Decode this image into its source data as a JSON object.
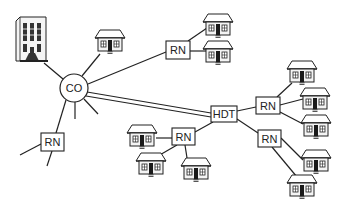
{
  "diagram": {
    "type": "network-topology",
    "nodes": {
      "central_office": {
        "label": "CO",
        "shape": "circle",
        "cx": 74,
        "cy": 88,
        "r": 14
      },
      "hdt": {
        "label": "HDT",
        "shape": "box",
        "x": 211,
        "y": 106,
        "w": 26,
        "h": 16
      },
      "rn_top": {
        "label": "RN",
        "shape": "box",
        "x": 166,
        "y": 41,
        "w": 24,
        "h": 18
      },
      "rn_left": {
        "label": "RN",
        "shape": "box",
        "x": 41,
        "y": 133,
        "w": 23,
        "h": 18
      },
      "rn_center": {
        "label": "RN",
        "shape": "box",
        "x": 172,
        "y": 128,
        "w": 23,
        "h": 17
      },
      "rn_right_upper": {
        "label": "RN",
        "shape": "box",
        "x": 256,
        "y": 97,
        "w": 24,
        "h": 17
      },
      "rn_right_lower": {
        "label": "RN",
        "shape": "box",
        "x": 258,
        "y": 130,
        "w": 23,
        "h": 17
      }
    },
    "building": {
      "icon": "office-building-icon",
      "x": 16,
      "y": 17,
      "w": 30,
      "h": 48
    },
    "houses": [
      {
        "id": "house-co",
        "x": 95,
        "y": 29
      },
      {
        "id": "house-rn-top-1",
        "x": 203,
        "y": 13
      },
      {
        "id": "house-rn-top-2",
        "x": 203,
        "y": 40
      },
      {
        "id": "house-rnru-1",
        "x": 287,
        "y": 61
      },
      {
        "id": "house-rnru-2",
        "x": 300,
        "y": 87
      },
      {
        "id": "house-rnru-3",
        "x": 301,
        "y": 114
      },
      {
        "id": "house-rnrl-1",
        "x": 301,
        "y": 149
      },
      {
        "id": "house-rnrl-2",
        "x": 287,
        "y": 175
      },
      {
        "id": "house-rnc-1",
        "x": 128,
        "y": 124
      },
      {
        "id": "house-rnc-2",
        "x": 136,
        "y": 152
      },
      {
        "id": "house-rnc-3",
        "x": 181,
        "y": 157
      }
    ],
    "links": [
      {
        "from": "central_office",
        "to": "building",
        "style": "single"
      },
      {
        "from": "central_office",
        "to": "house-co",
        "style": "single"
      },
      {
        "from": "central_office",
        "to": "rn_top",
        "style": "single"
      },
      {
        "from": "central_office",
        "to": "hdt",
        "style": "double"
      },
      {
        "from": "central_office",
        "to": "rn_left",
        "style": "single"
      },
      {
        "from": "central_office",
        "to": "stub-down",
        "style": "single"
      },
      {
        "from": "central_office",
        "to": "stub-down-right",
        "style": "single"
      },
      {
        "from": "rn_left",
        "to": "stub-left",
        "style": "single"
      },
      {
        "from": "rn_left",
        "to": "stub-down",
        "style": "single"
      },
      {
        "from": "rn_top",
        "to": "house-rn-top-1",
        "style": "single"
      },
      {
        "from": "rn_top",
        "to": "house-rn-top-2",
        "style": "single"
      },
      {
        "from": "hdt",
        "to": "rn_right_upper",
        "style": "single"
      },
      {
        "from": "hdt",
        "to": "rn_right_lower",
        "style": "single"
      },
      {
        "from": "hdt",
        "to": "rn_center",
        "style": "single"
      },
      {
        "from": "rn_right_upper",
        "to": "house-rnru-1",
        "style": "single"
      },
      {
        "from": "rn_right_upper",
        "to": "house-rnru-2",
        "style": "single"
      },
      {
        "from": "rn_right_upper",
        "to": "house-rnru-3",
        "style": "single"
      },
      {
        "from": "rn_right_lower",
        "to": "house-rnrl-1",
        "style": "single"
      },
      {
        "from": "rn_right_lower",
        "to": "house-rnrl-2",
        "style": "single"
      },
      {
        "from": "rn_center",
        "to": "house-rnc-1",
        "style": "single"
      },
      {
        "from": "rn_center",
        "to": "house-rnc-2",
        "style": "single"
      },
      {
        "from": "rn_center",
        "to": "house-rnc-3",
        "style": "single"
      }
    ],
    "colors": {
      "stroke": "#222222",
      "fill": "#ffffff",
      "door": "#1a1a1a",
      "wall": "#f2f2f2"
    }
  }
}
